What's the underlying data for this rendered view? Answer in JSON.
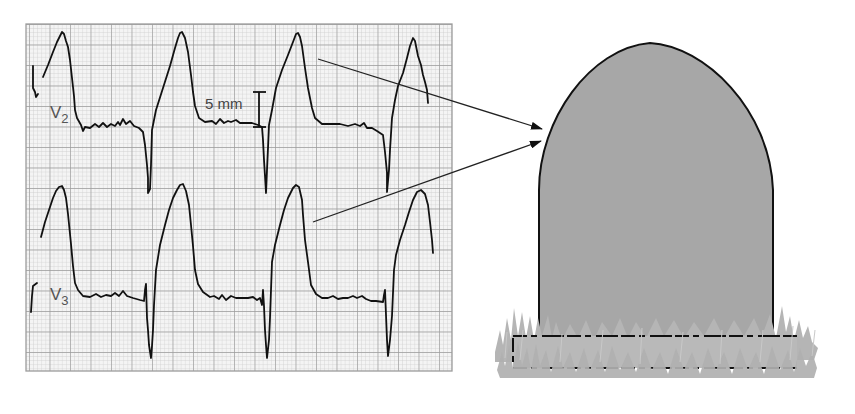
{
  "figure": {
    "ecg_panel": {
      "x": 26,
      "y": 24,
      "width": 426,
      "height": 347,
      "major_grid_px": 20.5,
      "minor_per_major": 5,
      "colors": {
        "background": "#f4f4f4",
        "minor": "#cfcfcf",
        "major": "#9c9c9c",
        "trace": "#111111"
      }
    },
    "leads": [
      {
        "name": "V",
        "sub": "2",
        "label_x": 50,
        "label_y": 118
      },
      {
        "name": "V",
        "sub": "3",
        "label_x": 50,
        "label_y": 300
      }
    ],
    "scale_bar": {
      "label": "5 mm",
      "x": 259,
      "y_top": 92,
      "y_bottom": 126
    },
    "arrows": [
      {
        "from": [
          318,
          59
        ],
        "to": [
          542,
          129
        ]
      },
      {
        "from": [
          313,
          222
        ],
        "to": [
          541,
          141
        ]
      }
    ],
    "tombstone": {
      "fill": "#a7a7a7",
      "outline": "#111111",
      "grass": "#b3b3b3",
      "grass_highlight": "#c9c9c9"
    }
  }
}
